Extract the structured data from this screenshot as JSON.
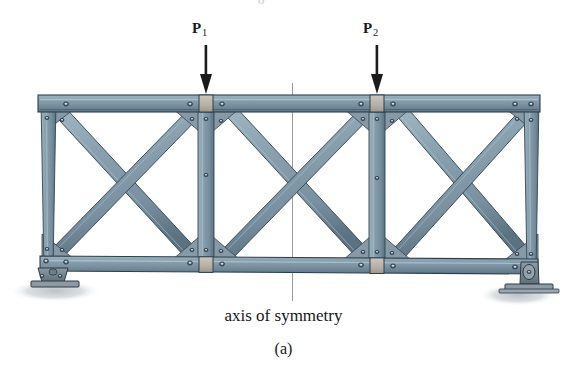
{
  "figure": {
    "type": "engineering-diagram",
    "caption": "(a)",
    "axis_caption": "axis of symmetry",
    "loads": [
      {
        "name": "P1",
        "symbol": "P",
        "subscript": "1",
        "direction": "down",
        "x": 206
      },
      {
        "name": "P2",
        "symbol": "P",
        "subscript": "2",
        "direction": "down",
        "x": 377
      }
    ],
    "axis_of_symmetry": {
      "x": 292,
      "y_top": 83,
      "y_bottom": 300
    },
    "supports": [
      {
        "name": "pin-support-left",
        "x": 52,
        "y": 281
      },
      {
        "name": "roller-support-right",
        "x": 516,
        "y": 281
      }
    ],
    "geometry": {
      "top_chord_y": 97,
      "bottom_chord_y": 270,
      "left_x": 40,
      "right_x": 540,
      "panel_points_x": [
        40,
        206,
        377,
        540
      ],
      "member_color": "#7e97a6",
      "member_edge_color": "#2e3f4a",
      "splice_plate_color": "#b9b2a8",
      "background_color": "#ffffff",
      "shadow_color": "#d7dadd"
    },
    "members": {
      "top_chord": "horizontal-top-chord",
      "bottom_chord": "horizontal-bottom-chord",
      "verticals": 4,
      "diagonals": 6,
      "panels": 3
    },
    "colors": {
      "steel": "#7e97a6",
      "steel_dark": "#3d4f5b",
      "steel_light": "#a9bfca",
      "ink": "#1b1b1b",
      "plate": "#b9b2a8"
    }
  }
}
